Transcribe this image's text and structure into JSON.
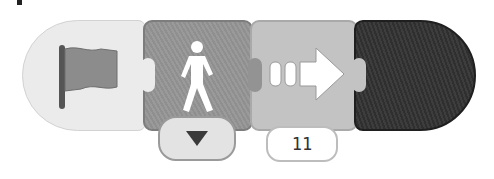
{
  "script": {
    "blocks": [
      {
        "type": "start",
        "icon": "green-flag-icon",
        "color": "#ebebeb"
      },
      {
        "type": "walk",
        "icon": "walking-person-icon",
        "color": "#939393",
        "dropdown": {
          "icon": "dropdown-triangle-icon"
        }
      },
      {
        "type": "move-forward",
        "icon": "move-forward-arrow-icon",
        "color": "#c3c3c3",
        "value": "11"
      },
      {
        "type": "end",
        "icon": "none",
        "color": "#353535"
      }
    ]
  }
}
